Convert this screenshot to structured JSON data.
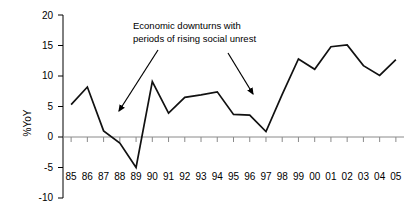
{
  "chart_data": {
    "type": "line",
    "title": "",
    "xlabel": "",
    "ylabel": "%YoY",
    "categories": [
      "85",
      "86",
      "87",
      "88",
      "89",
      "90",
      "91",
      "92",
      "93",
      "94",
      "95",
      "96",
      "97",
      "98",
      "99",
      "00",
      "01",
      "02",
      "03",
      "04",
      "05"
    ],
    "values": [
      5.3,
      8.2,
      1.0,
      -1.0,
      -5.0,
      9.1,
      3.9,
      6.5,
      6.9,
      7.4,
      3.7,
      3.6,
      0.9,
      7.0,
      12.8,
      11.1,
      14.8,
      15.1,
      11.7,
      10.1,
      12.7
    ],
    "series": [
      {
        "name": "%YoY",
        "values": [
          5.3,
          8.2,
          1.0,
          -1.0,
          -5.0,
          9.1,
          3.9,
          6.5,
          6.9,
          7.4,
          3.7,
          3.6,
          0.9,
          7.0,
          12.8,
          11.1,
          14.8,
          15.1,
          11.7,
          10.1,
          12.7
        ]
      }
    ],
    "ylim": [
      -10,
      20
    ],
    "ytick_labels": [
      "20",
      "15",
      "10",
      "5",
      "0",
      "-5",
      "-10"
    ],
    "ytick_values": [
      20,
      15,
      10,
      5,
      0,
      -5,
      -10
    ],
    "grid": false,
    "legend": "none",
    "line_color": "#111111",
    "zero_line_color": "#8a8a8a",
    "annotations": [
      {
        "id": "downturns-note",
        "line1": "Economic downturns with",
        "line2": "periods of rising social unrest",
        "arrows": [
          {
            "id": "arrow-left",
            "target_year": "88",
            "target_value": 4.2
          },
          {
            "id": "arrow-right",
            "target_year": "96",
            "target_value": 7.1
          }
        ]
      }
    ]
  }
}
